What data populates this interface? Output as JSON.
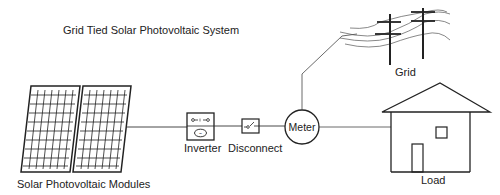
{
  "title": "Grid Tied Solar Photovoltaic System",
  "components": {
    "solar_modules": {
      "label": "Solar Photovoltaic Modules",
      "icon": "solar-panel-icon"
    },
    "inverter": {
      "label": "Inverter",
      "icon": "inverter-icon",
      "symbol": "~"
    },
    "disconnect": {
      "label": "Disconnect",
      "icon": "switch-icon"
    },
    "meter": {
      "label": "Meter",
      "icon": "meter-icon"
    },
    "grid": {
      "label": "Grid",
      "icon": "utility-pole-icon"
    },
    "load": {
      "label": "Load",
      "icon": "house-icon"
    }
  },
  "colors": {
    "line": "#222222",
    "background": "#ffffff",
    "text": "#222222"
  }
}
